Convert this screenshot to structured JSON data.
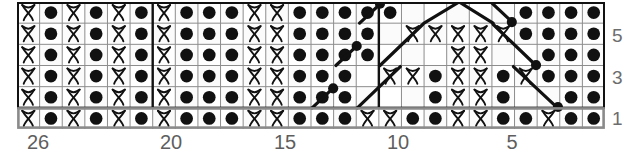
{
  "chart_data": {
    "type": "table",
    "title": "",
    "subtitle": "",
    "xlabel": "",
    "ylabel": "",
    "legend_position": "none",
    "grid": true,
    "chart_kind": "knitting-stitch-chart",
    "columns": 26,
    "rows": 6,
    "column_direction": "right-to-left",
    "column_tick_labels": [
      "26",
      "20",
      "15",
      "10",
      "5"
    ],
    "column_tick_indexes": [
      1,
      7,
      12,
      17,
      22
    ],
    "row_tick_labels": [
      "5",
      "3",
      "1"
    ],
    "row_tick_rows": [
      5,
      3,
      1
    ],
    "symbols": {
      "purl": "●",
      "twisted_knit": "knot",
      "blank": "",
      "cable_right": "diagonal-up-right",
      "cable_left": "diagonal-up-left"
    },
    "legend_entries": [],
    "colors": {
      "cell_fill": "#ffffff",
      "cell_alt_fill": "#fbfbfb",
      "gridline": "#8d8d8d",
      "outline": "#111111",
      "row1_outline": "#8a8a8a",
      "symbol": "#111111",
      "label_text": "#5e5e5e"
    },
    "note": "Row 1 is highlighted with a grey outline band at the bottom of the chart.",
    "cells": [
      [
        "K",
        "P",
        "K",
        "P",
        "K",
        "P",
        "K",
        "P",
        "P",
        "P",
        "K",
        "K",
        "P",
        "P",
        "P",
        "K",
        "K",
        "P",
        "P",
        "K",
        "K",
        "P",
        "P",
        "K",
        "P",
        "P"
      ],
      [
        "K",
        "P",
        "K",
        "P",
        "K",
        "P",
        "K",
        "P",
        "P",
        "P",
        "K",
        "K",
        "P",
        "P",
        "P",
        "P",
        "B",
        "B",
        "P",
        "K",
        "K",
        "P",
        "B",
        "B",
        "P",
        "P"
      ],
      [
        "K",
        "P",
        "K",
        "P",
        "K",
        "P",
        "K",
        "P",
        "P",
        "P",
        "K",
        "K",
        "P",
        "P",
        "P",
        "P",
        "K",
        "K",
        "P",
        "K",
        "K",
        "P",
        "K",
        "P",
        "P",
        "P"
      ],
      [
        "K",
        "P",
        "K",
        "P",
        "K",
        "P",
        "K",
        "P",
        "P",
        "P",
        "K",
        "K",
        "P",
        "P",
        "P",
        "P",
        "B",
        "B",
        "K",
        "K",
        "B",
        "B",
        "B",
        "P",
        "P",
        "P"
      ],
      [
        "K",
        "P",
        "K",
        "P",
        "K",
        "P",
        "K",
        "P",
        "P",
        "P",
        "K",
        "K",
        "P",
        "P",
        "P",
        "P",
        "K",
        "K",
        "K",
        "K",
        "K",
        "P",
        "P",
        "P",
        "P"
      ],
      [
        "K",
        "P",
        "K",
        "P",
        "K",
        "P",
        "K",
        "P",
        "P",
        "P",
        "K",
        "K",
        "P",
        "P",
        "P",
        "P",
        "B",
        "B",
        "B",
        "B",
        "B",
        "P",
        "P",
        "P",
        "P",
        "P"
      ]
    ],
    "rows_detail": [
      {
        "row": 1,
        "highlight": true,
        "cells": [
          "K",
          "P",
          "K",
          "P",
          "K",
          "P",
          "K",
          "P",
          "P",
          "P",
          "K",
          "K",
          "P",
          "P",
          "P",
          "K",
          "K",
          "P",
          "P",
          "K",
          "K",
          "P",
          "P",
          "K",
          "P",
          "P"
        ]
      },
      {
        "row": 2,
        "highlight": false,
        "cells": [
          "K",
          "P",
          "K",
          "P",
          "K",
          "P",
          "K",
          "P",
          "P",
          "P",
          "K",
          "K",
          "P",
          "P",
          "P",
          "P",
          "cable",
          "blank",
          "blank",
          "K",
          "K",
          "P",
          "cable",
          "cable",
          "P",
          "P"
        ]
      },
      {
        "row": 3,
        "highlight": false,
        "cells": [
          "K",
          "P",
          "K",
          "P",
          "K",
          "P",
          "K",
          "P",
          "P",
          "P",
          "K",
          "K",
          "P",
          "P",
          "P",
          "P",
          "K",
          "K",
          "P",
          "K",
          "K",
          "P",
          "K",
          "P",
          "P",
          "P"
        ]
      },
      {
        "row": 4,
        "highlight": false,
        "cells": [
          "K",
          "P",
          "K",
          "P",
          "K",
          "P",
          "K",
          "P",
          "P",
          "P",
          "K",
          "K",
          "P",
          "P",
          "P",
          "P",
          "cable",
          "blank",
          "blank",
          "K",
          "K",
          "cable",
          "cable",
          "P",
          "P",
          "P"
        ]
      },
      {
        "row": 5,
        "highlight": false,
        "cells": [
          "K",
          "P",
          "K",
          "P",
          "K",
          "P",
          "K",
          "P",
          "P",
          "P",
          "K",
          "K",
          "P",
          "P",
          "P",
          "P",
          "P",
          "K",
          "K",
          "K",
          "K",
          "K",
          "P",
          "P",
          "P",
          "P"
        ]
      },
      {
        "row": 6,
        "highlight": false,
        "cells": [
          "K",
          "P",
          "K",
          "P",
          "K",
          "P",
          "K",
          "P",
          "P",
          "P",
          "K",
          "K",
          "P",
          "P",
          "P",
          "P",
          "P",
          "cable",
          "blank",
          "blank",
          "blank",
          "cable",
          "P",
          "P",
          "P",
          "P"
        ]
      }
    ]
  }
}
